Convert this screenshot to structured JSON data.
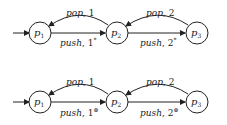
{
  "diagrams": [
    {
      "nodes": [
        {
          "id": "p1",
          "label": "p",
          "sub": "1"
        },
        {
          "id": "p2",
          "label": "p",
          "sub": "2"
        },
        {
          "id": "p3",
          "label": "p",
          "sub": "3"
        }
      ],
      "edges": {
        "pop1": {
          "op": "pop",
          "arg": "1",
          "sup": ""
        },
        "pop2": {
          "op": "pop",
          "arg": "2",
          "sup": ""
        },
        "push1": {
          "op": "push",
          "arg": "1",
          "sup": "*"
        },
        "push2": {
          "op": "push",
          "arg": "2",
          "sup": "*"
        }
      }
    },
    {
      "nodes": [
        {
          "id": "p1",
          "label": "p",
          "sub": "1"
        },
        {
          "id": "p2",
          "label": "p",
          "sub": "2"
        },
        {
          "id": "p3",
          "label": "p",
          "sub": "3"
        }
      ],
      "edges": {
        "pop1": {
          "op": "pop",
          "arg": "1",
          "sup": ""
        },
        "pop2": {
          "op": "pop",
          "arg": "2",
          "sup": ""
        },
        "push1": {
          "op": "push",
          "arg": "1",
          "sup": "⊛"
        },
        "push2": {
          "op": "push",
          "arg": "2",
          "sup": "⊛"
        }
      }
    }
  ]
}
